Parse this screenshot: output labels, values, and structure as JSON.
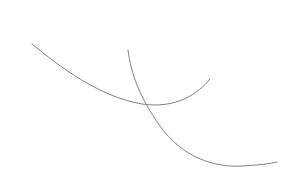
{
  "canvas": {
    "width": 282,
    "height": 186,
    "background_color": "#ffffff",
    "label": "white drawing canvas"
  },
  "chart_data": {
    "type": "line",
    "title": "",
    "subtitle": "",
    "xlabel": "",
    "ylabel": "",
    "grid": false,
    "legend_position": "none",
    "xlim": [
      0,
      282
    ],
    "ylim": [
      186,
      0
    ],
    "note": "Two thin gray open arcs drawn on a blank white field; pixel coordinates with y increasing downward.",
    "series": [
      {
        "name": "curve-1-left-arc",
        "color": "#808080",
        "stroke_width": 1,
        "start_point": [
          32,
          44
        ],
        "end_point": [
          210,
          79
        ],
        "lowest_point": [
          142,
          104
        ],
        "x": [
          32,
          45,
          58,
          72,
          86,
          100,
          114,
          128,
          142,
          156,
          170,
          184,
          197,
          210
        ],
        "y": [
          44,
          54,
          64,
          73,
          82,
          90,
          97,
          101,
          104,
          103,
          99,
          93,
          86,
          79
        ],
        "path_d": "M 32 44 C 60 67, 100 97, 142 104 C 176 109, 198 94, 210 79"
      },
      {
        "name": "curve-2-right-arc",
        "color": "#808080",
        "stroke_width": 1,
        "start_point": [
          128,
          50
        ],
        "end_point": [
          277,
          162
        ],
        "lowest_point": [
          243,
          166
        ],
        "x": [
          128,
          133,
          140,
          147,
          155,
          164,
          175,
          188,
          203,
          219,
          235,
          250,
          264,
          277
        ],
        "y": [
          50,
          66,
          84,
          103,
          118,
          131,
          143,
          152,
          159,
          164,
          166,
          166,
          164,
          162
        ],
        "path_d": "M 128 50 C 131 74, 140 98, 160 126 C 182 157, 214 168, 243 166 C 258 165, 269 164, 277 162"
      }
    ],
    "intersection": {
      "label": "curve-crossing-point",
      "x": 147,
      "y": 103
    }
  }
}
